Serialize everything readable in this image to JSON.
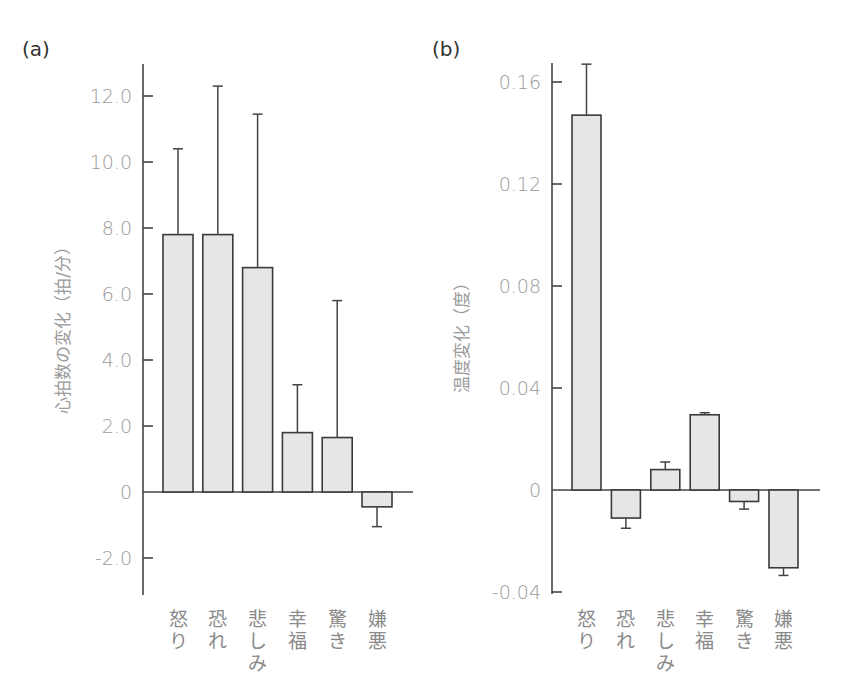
{
  "chart_data": [
    {
      "panel": "(a)",
      "type": "bar",
      "title": "",
      "xlabel": "",
      "ylabel": "心拍数の変化（拍/分）",
      "ylim": [
        -3.1,
        12.9
      ],
      "yticks": [
        12.0,
        10.0,
        8.0,
        6.0,
        4.0,
        2.0,
        0,
        -2.0
      ],
      "ytick_labels": [
        "12.0",
        "10.0",
        "8.0",
        "6.0",
        "4.0",
        "2.0",
        "0",
        "-2.0"
      ],
      "categories": [
        "怒り",
        "恐れ",
        "悲しみ",
        "幸福",
        "驚き",
        "嫌悪"
      ],
      "values": [
        7.8,
        7.8,
        6.8,
        1.8,
        1.65,
        -0.45
      ],
      "error": [
        2.6,
        4.5,
        4.65,
        1.45,
        4.15,
        0.6
      ],
      "grid": false
    },
    {
      "panel": "(b)",
      "type": "bar",
      "title": "",
      "xlabel": "",
      "ylabel": "温度変化（度）",
      "ylim": [
        -0.041,
        0.171
      ],
      "yticks": [
        0.16,
        0.12,
        0.08,
        0.04,
        0,
        -0.04
      ],
      "ytick_labels": [
        "0.16",
        "0.12",
        "0.08",
        "0.04",
        "0",
        "-0.04"
      ],
      "categories": [
        "怒り",
        "恐れ",
        "悲しみ",
        "幸福",
        "驚き",
        "嫌悪"
      ],
      "values": [
        0.147,
        -0.011,
        0.008,
        0.0295,
        -0.0045,
        -0.0305
      ],
      "error": [
        0.02,
        0.004,
        0.003,
        0.0008,
        0.003,
        0.003
      ],
      "grid": false
    }
  ]
}
